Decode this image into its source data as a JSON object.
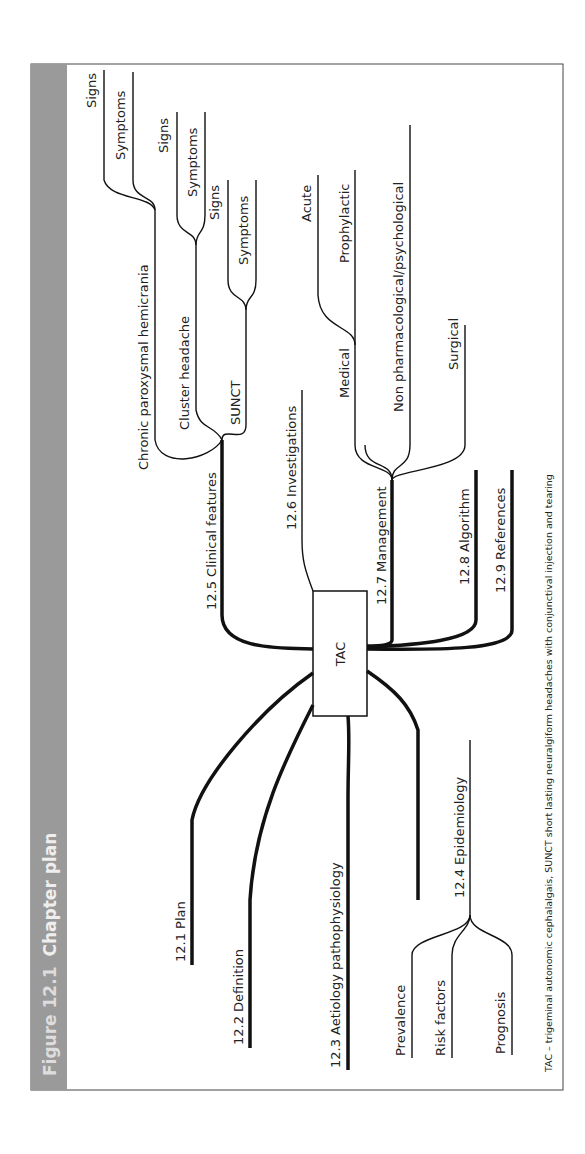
{
  "figure": {
    "number": "Figure 12.1",
    "title": "Chapter plan",
    "header_color": "#9a9a9a",
    "caption": "TAC – trigeminal autonomic cephalalgais, SUNCT short lasting neuralgiform headaches with conjunctival injection and tearing"
  },
  "center": {
    "label": "TAC"
  },
  "branches": {
    "plan": "12.1 Plan",
    "definition": "12.2 Definition",
    "aetiology": "12.3 Aetiology pathophysiology",
    "epidemiology": {
      "label": "12.4 Epidemiology",
      "children": [
        "Prevalence",
        "Risk factors",
        "Prognosis"
      ]
    },
    "clinical": {
      "label": "12.5 Clinical features",
      "children": [
        {
          "label": "Chronic paroxysmal hemicrania",
          "sub": [
            "Signs",
            "Symptoms"
          ]
        },
        {
          "label": "Cluster headache",
          "sub": [
            "Signs",
            "Symptoms"
          ]
        },
        {
          "label": "SUNCT",
          "sub": [
            "Signs",
            "Symptoms"
          ]
        }
      ]
    },
    "investigations": "12.6 Investigations",
    "management": {
      "label": "12.7 Management",
      "children": [
        {
          "label": "Medical",
          "sub": [
            "Acute",
            "Prophylactic"
          ]
        },
        {
          "label": "Non pharmacological/psychological"
        },
        {
          "label": "Surgical"
        }
      ]
    },
    "algorithm": "12.8 Algorithm",
    "references": "12.9 References"
  }
}
